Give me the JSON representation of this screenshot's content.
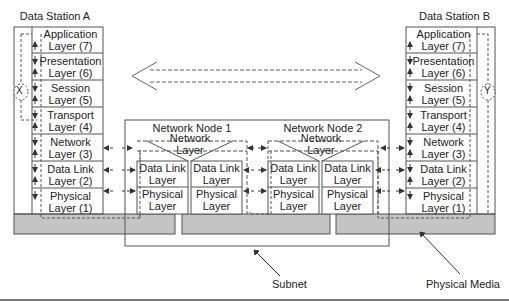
{
  "station_a": {
    "title": "Data Station A",
    "end_marker": "X",
    "layers": [
      {
        "name": "Application",
        "num": "Layer (7)"
      },
      {
        "name": "Presentation",
        "num": "Layer (6)"
      },
      {
        "name": "Session",
        "num": "Layer (5)"
      },
      {
        "name": "Transport",
        "num": "Layer (4)"
      },
      {
        "name": "Network",
        "num": "Layer (3)"
      },
      {
        "name": "Data Link",
        "num": "Layer (2)"
      },
      {
        "name": "Physical",
        "num": "Layer (1)"
      }
    ]
  },
  "station_b": {
    "title": "Data Station B",
    "end_marker": "Y",
    "layers": [
      {
        "name": "Application",
        "num": "Layer (7)"
      },
      {
        "name": "Presentation",
        "num": "Layer (6)"
      },
      {
        "name": "Session",
        "num": "Layer (5)"
      },
      {
        "name": "Transport",
        "num": "Layer (4)"
      },
      {
        "name": "Network",
        "num": "Layer (3)"
      },
      {
        "name": "Data Link",
        "num": "Layer (2)"
      },
      {
        "name": "Physical",
        "num": "Layer (1)"
      }
    ]
  },
  "node1": {
    "title": "Network Node 1",
    "network_layer": [
      "Network",
      "Layer"
    ],
    "left": {
      "dl": [
        "Data Link",
        "Layer"
      ],
      "ph": [
        "Physical",
        "Layer"
      ]
    },
    "right": {
      "dl": [
        "Data Link",
        "Layer"
      ],
      "ph": [
        "Physical",
        "Layer"
      ]
    }
  },
  "node2": {
    "title": "Network Node 2",
    "network_layer": [
      "Network",
      "Layer"
    ],
    "left": {
      "dl": [
        "Data Link",
        "Layer"
      ],
      "ph": [
        "Physical",
        "Layer"
      ]
    },
    "right": {
      "dl": [
        "Data Link",
        "Layer"
      ],
      "ph": [
        "Physical",
        "Layer"
      ]
    }
  },
  "callouts": {
    "subnet": "Subnet",
    "physical_media": "Physical Media"
  },
  "colors": {
    "media_fill": "#c4c4c4",
    "line": "#444444",
    "dash": "#555555"
  }
}
